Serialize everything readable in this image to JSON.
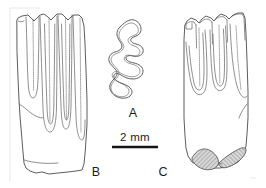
{
  "figure": {
    "background_color": "#ffffff",
    "outline_color": "#4a4a4a",
    "label_color": "#1b1b1b",
    "width_px": 266,
    "height_px": 188
  },
  "scale_bar": {
    "label": "2 mm",
    "length_px": 46,
    "bar_color": "#151515",
    "x_start": 112,
    "x_end": 158,
    "y": 147
  },
  "panels": [
    {
      "id": "A",
      "label": "A",
      "view": "occlusal",
      "description": "Occlusal outline of molar showing zigzag prismatic enamel pattern with alternating triangles",
      "label_x": 133,
      "label_y": 117
    },
    {
      "id": "B",
      "label": "B",
      "view": "lateral",
      "description": "Lateral view of rootless hypsodont molar with four vertical enamel folds and scalloped crown",
      "label_x": 96,
      "label_y": 176
    },
    {
      "id": "C",
      "label": "C",
      "view": "lateral-rooted",
      "description": "Lateral oblique view of rooted molar with three vertical folds and two hatched roots at base",
      "label_x": 163,
      "label_y": 176
    }
  ],
  "annotations": {
    "root_shading": "cross-hatched",
    "root_count": 2,
    "fold_count_b": 4,
    "fold_count_c": 3
  }
}
